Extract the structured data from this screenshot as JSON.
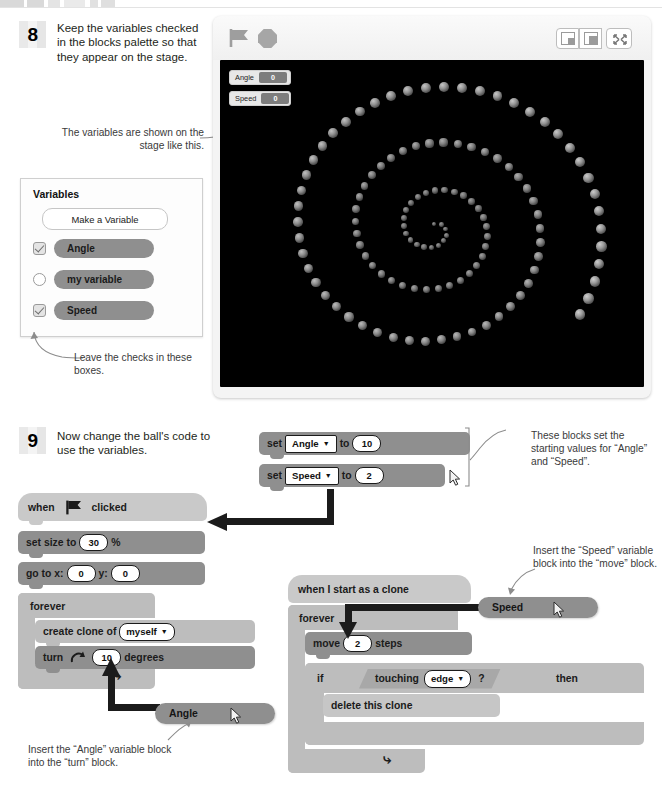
{
  "document": {
    "title": "Scratch tutorial page — spiral ball project, steps 8 and 9"
  },
  "steps": [
    {
      "number": "8",
      "text": "Keep the variables checked in the blocks palette so that they appear on the stage."
    },
    {
      "number": "9",
      "text": "Now change the ball's code to use the variables."
    }
  ],
  "captions": {
    "stage_monitors": "The variables are shown on the stage like this.",
    "leave_checks": "Leave the checks in these boxes.",
    "set_blocks": "These blocks set the starting values for “Angle” and “Speed”.",
    "insert_speed": "Insert the “Speed” variable block into the “move” block.",
    "insert_angle": "Insert the “Angle” variable block into the “turn” block."
  },
  "palette": {
    "title": "Variables",
    "make_variable_button": "Make a Variable",
    "variables": [
      {
        "name": "Angle",
        "checked": true
      },
      {
        "name": "my variable",
        "checked": false
      },
      {
        "name": "Speed",
        "checked": true
      }
    ]
  },
  "stage": {
    "green_flag_icon": "green-flag-icon",
    "stop_icon": "stop-sign-icon",
    "controls": [
      {
        "icon": "small-stage-icon"
      },
      {
        "icon": "large-stage-icon"
      },
      {
        "icon": "fullscreen-icon"
      }
    ],
    "monitors": [
      {
        "label": "Angle",
        "value": "0"
      },
      {
        "label": "Speed",
        "value": "0"
      }
    ],
    "background_color": "#000000"
  },
  "scripts": {
    "set_stack": {
      "blocks": [
        {
          "prefix": "set",
          "variable": "Angle",
          "mid": "to",
          "value": "10"
        },
        {
          "prefix": "set",
          "variable": "Speed",
          "mid": "to",
          "value": "2"
        }
      ]
    },
    "flag_stack": {
      "hat": {
        "pre": "when",
        "icon": "green-flag-icon",
        "post": "clicked"
      },
      "blocks": [
        {
          "pre": "set size to",
          "value": "30",
          "post": "%"
        },
        {
          "pre": "go to x:",
          "value": "0",
          "mid": "y:",
          "value2": "0"
        },
        {
          "label": "forever"
        },
        {
          "pre": "create clone of",
          "dropdown": "myself"
        },
        {
          "pre": "turn",
          "icon": "turn-right-icon",
          "value": "10",
          "post": "degrees"
        }
      ],
      "loop_icon": "loop-arrow-icon"
    },
    "clone_stack": {
      "hat": {
        "label": "when I start as a clone"
      },
      "blocks": [
        {
          "label": "forever"
        },
        {
          "pre": "move",
          "value": "2",
          "post": "steps"
        },
        {
          "pre": "if",
          "condition_pre": "touching",
          "condition_dropdown": "edge",
          "condition_post": "?",
          "post": "then"
        },
        {
          "label": "delete this clone"
        }
      ],
      "loop_icon": "loop-arrow-icon"
    },
    "loose_variable_blocks": [
      {
        "name": "Angle"
      },
      {
        "name": "Speed"
      }
    ]
  },
  "colors": {
    "block_mid": "#8f8f8f",
    "block_light": "#bdbdbd",
    "block_hat": "#c9c9c9",
    "stage_bg": "#000000",
    "connector": "#1b1b1b"
  },
  "chart_data": {
    "type": "scatter",
    "xlabel": "",
    "ylabel": "",
    "grid": false,
    "legend": "none",
    "point_count": 118
  }
}
